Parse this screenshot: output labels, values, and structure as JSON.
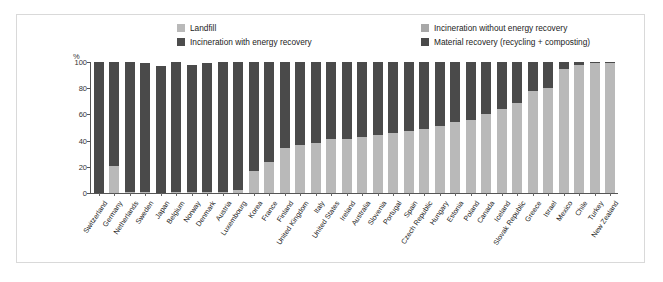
{
  "chart_data": {
    "type": "bar",
    "subtype": "stacked-bar",
    "title": "",
    "xlabel": "",
    "ylabel": "%",
    "ylim": [
      0,
      100
    ],
    "yticks": [
      0,
      20,
      40,
      60,
      80,
      100
    ],
    "grid": false,
    "legend_position": "top",
    "colors": {
      "landfill": "#b9b9b9",
      "incineration_without_energy_recovery": "#a8a8a8",
      "incineration_with_energy_recovery": "#4d4d4d",
      "material_recovery": "#4a4a4a",
      "frame": "#d9d9d9",
      "axis": "#555555",
      "text": "#1a1a1a"
    },
    "legend": [
      {
        "key": "landfill",
        "label": "Landfill",
        "color": "#b9b9b9"
      },
      {
        "key": "incineration_without",
        "label": "Incineration without energy recovery",
        "color": "#a8a8a8"
      },
      {
        "key": "incineration_with",
        "label": "Incineration with energy recovery",
        "color": "#4d4d4d"
      },
      {
        "key": "material_recovery",
        "label": "Material recovery (recycling + composting)",
        "color": "#4a4a4a"
      }
    ],
    "categories": [
      "Switzerland",
      "Germany",
      "Netherlands",
      "Sweden",
      "Japan",
      "Belgium",
      "Norway",
      "Denmark",
      "Austria",
      "Luxembourg",
      "Korea",
      "France",
      "Finland",
      "United Kingdom",
      "Italy",
      "United States",
      "Ireland",
      "Australia",
      "Slovenia",
      "Portugal",
      "Spain",
      "Czech Republic",
      "Hungary",
      "Estonia",
      "Poland",
      "Canada",
      "Iceland",
      "Slovak Republic",
      "Greece",
      "Israel",
      "Mexico",
      "Chile",
      "Turkey",
      "New Zealand"
    ],
    "series": [
      {
        "name": "Recovery (material + incineration with energy recovery)",
        "color": "#4a4a4a",
        "values": [
          100,
          79,
          99,
          98,
          97,
          99,
          97,
          98,
          99,
          98,
          83,
          76,
          66,
          63,
          62,
          59,
          59,
          57,
          56,
          54,
          53,
          51,
          49,
          46,
          44,
          40,
          36,
          31,
          22,
          20,
          5,
          2,
          1,
          1
        ]
      },
      {
        "name": "Landfill",
        "color": "#b9b9b9",
        "values": [
          0,
          21,
          1,
          1,
          0,
          1,
          1,
          1,
          1,
          2,
          17,
          24,
          34,
          37,
          38,
          41,
          41,
          43,
          44,
          46,
          47,
          49,
          51,
          54,
          56,
          60,
          64,
          69,
          78,
          80,
          95,
          98,
          99,
          99
        ]
      }
    ]
  }
}
